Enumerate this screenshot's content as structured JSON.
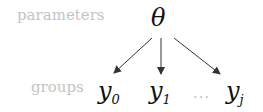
{
  "labels": {
    "parameters": "parameters",
    "groups": "groups"
  },
  "parameter_node": {
    "symbol": "θ"
  },
  "group_nodes": [
    {
      "base": "y",
      "sub": "0"
    },
    {
      "base": "y",
      "sub": "1"
    },
    {
      "base": "y",
      "sub": "j"
    }
  ],
  "ellipsis": "...",
  "colors": {
    "label": "#c4c4c4",
    "math": "#111111",
    "arrow": "#333333"
  }
}
